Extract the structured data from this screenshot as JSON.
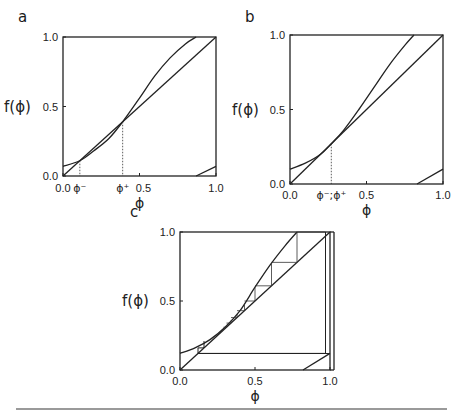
{
  "figure": {
    "panels": [
      {
        "id": "a",
        "label": "a",
        "ylabel": "f(ϕ)",
        "xlabel": "ϕ",
        "yticks": [
          "0.0",
          "0.5",
          "1.0"
        ],
        "xticks": [
          "0.0",
          "0.5",
          "1.0"
        ],
        "fixed_point_labels": [
          "ϕ⁻",
          "ϕ⁺"
        ]
      },
      {
        "id": "b",
        "label": "b",
        "ylabel": "f(ϕ)",
        "xlabel": "ϕ",
        "yticks": [
          "0.0",
          "0.5",
          "1.0"
        ],
        "xticks": [
          "0.0",
          "0.5",
          "1.0"
        ],
        "fixed_point_labels": [
          "ϕ⁻;ϕ⁺"
        ]
      },
      {
        "id": "c",
        "label": "c",
        "ylabel": "f(ϕ)",
        "xlabel": "ϕ",
        "yticks": [
          "0.0",
          "0.5",
          "1.0"
        ],
        "xticks": [
          "0.0",
          "0.5",
          "1.0"
        ]
      }
    ]
  },
  "chart_data": [
    {
      "type": "line",
      "title": "a",
      "xlabel": "ϕ",
      "ylabel": "f(ϕ)",
      "xlim": [
        0,
        1
      ],
      "ylim": [
        0,
        1
      ],
      "series": [
        {
          "name": "identity",
          "x": [
            0,
            1
          ],
          "y": [
            0,
            1
          ]
        },
        {
          "name": "f(ϕ)",
          "x": [
            0,
            0.11,
            0.2,
            0.3,
            0.39,
            0.5,
            0.6,
            0.7,
            0.8,
            0.87
          ],
          "y": [
            0.07,
            0.11,
            0.18,
            0.27,
            0.39,
            0.56,
            0.72,
            0.85,
            0.95,
            1.0
          ]
        },
        {
          "name": "f(ϕ) wrapped",
          "x": [
            0.87,
            1.0
          ],
          "y": [
            0.0,
            0.07
          ]
        }
      ],
      "annotations": [
        {
          "label": "ϕ⁻",
          "x": 0.11
        },
        {
          "label": "ϕ⁺",
          "x": 0.39
        }
      ]
    },
    {
      "type": "line",
      "title": "b",
      "xlabel": "ϕ",
      "ylabel": "f(ϕ)",
      "xlim": [
        0,
        1
      ],
      "ylim": [
        0,
        1
      ],
      "series": [
        {
          "name": "identity",
          "x": [
            0,
            1
          ],
          "y": [
            0,
            1
          ]
        },
        {
          "name": "f(ϕ)",
          "x": [
            0,
            0.1,
            0.2,
            0.27,
            0.35,
            0.45,
            0.55,
            0.65,
            0.75,
            0.81
          ],
          "y": [
            0.1,
            0.14,
            0.2,
            0.27,
            0.36,
            0.5,
            0.65,
            0.8,
            0.93,
            1.0
          ]
        },
        {
          "name": "f(ϕ) wrapped",
          "x": [
            0.83,
            1.0
          ],
          "y": [
            0.0,
            0.1
          ]
        }
      ],
      "annotations": [
        {
          "label": "ϕ⁻;ϕ⁺",
          "x": 0.27
        }
      ]
    },
    {
      "type": "line",
      "title": "c",
      "xlabel": "ϕ",
      "ylabel": "f(ϕ)",
      "xlim": [
        0,
        1
      ],
      "ylim": [
        0,
        1
      ],
      "series": [
        {
          "name": "identity",
          "x": [
            0,
            1
          ],
          "y": [
            0,
            1
          ]
        },
        {
          "name": "f(ϕ)",
          "x": [
            0,
            0.1,
            0.2,
            0.3,
            0.4,
            0.5,
            0.6,
            0.7,
            0.78
          ],
          "y": [
            0.12,
            0.16,
            0.22,
            0.31,
            0.43,
            0.6,
            0.76,
            0.9,
            1.0
          ]
        },
        {
          "name": "f(ϕ) wrapped",
          "x": [
            0.82,
            1.0
          ],
          "y": [
            0.0,
            0.12
          ]
        },
        {
          "name": "cobweb",
          "x": [
            0.97,
            0.97,
            0.12,
            0.12,
            0.16,
            0.16
          ],
          "y": [
            1.0,
            0.12,
            0.12,
            0.16,
            0.16,
            0.21
          ]
        }
      ]
    }
  ]
}
